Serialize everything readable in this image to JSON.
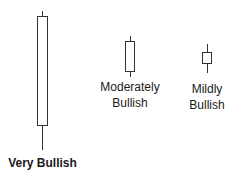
{
  "diagram": {
    "colors": {
      "outline": "#333333",
      "fill": "#ffffff",
      "text": "#1a1a1a"
    },
    "candles": [
      {
        "name": "very-bullish",
        "label_lines": [
          "Very Bullish"
        ],
        "bold": true,
        "wick_top": 11,
        "body_top": 16,
        "body_bottom": 126,
        "wick_bottom": 150,
        "x_left": 37,
        "x_right": 48
      },
      {
        "name": "moderately-bullish",
        "label_lines": [
          "Moderately",
          "Bullish"
        ],
        "bold": false,
        "wick_top": 36,
        "body_top": 41,
        "body_bottom": 72,
        "wick_bottom": 77,
        "x_left": 125,
        "x_right": 135
      },
      {
        "name": "mildly-bullish",
        "label_lines": [
          "Mildly",
          "Bullish"
        ],
        "bold": false,
        "wick_top": 44,
        "body_top": 52,
        "body_bottom": 64,
        "wick_bottom": 73,
        "x_left": 202,
        "x_right": 212
      }
    ]
  }
}
